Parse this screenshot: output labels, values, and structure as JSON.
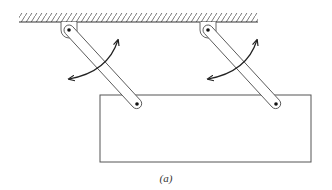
{
  "figure": {
    "caption": "(a)",
    "colors": {
      "line": "#444444",
      "background": "#ffffff"
    },
    "ceiling": {
      "x1": 19,
      "x2": 258,
      "y": 22,
      "hatch_height": 8
    },
    "links": [
      {
        "id": "left-link",
        "top_pin": [
          69,
          30
        ],
        "bottom_pin": [
          137,
          104
        ]
      },
      {
        "id": "right-link",
        "top_pin": [
          208,
          30
        ],
        "bottom_pin": [
          276,
          104
        ]
      }
    ],
    "plate": {
      "x": 100,
      "y": 95,
      "width": 211,
      "height": 67
    },
    "rotation_arrows": [
      {
        "id": "left-arrow",
        "start": [
          69,
          79
        ],
        "end": [
          118,
          40
        ]
      },
      {
        "id": "right-arrow",
        "start": [
          208,
          79
        ],
        "end": [
          257,
          40
        ]
      }
    ]
  }
}
